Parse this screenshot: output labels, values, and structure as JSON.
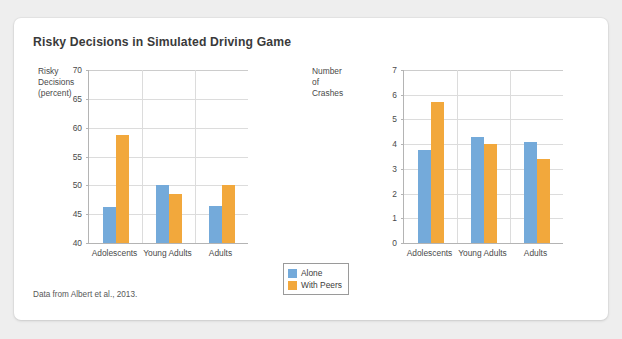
{
  "figure": {
    "title": "Risky Decisions in Simulated Driving Game",
    "source_note": "Data from Albert et al., 2013.",
    "colors": {
      "alone": "#74aada",
      "with_peers": "#f2a83c",
      "card_background": "#ffffff",
      "page_background": "#eeeeee",
      "gridline": "#dcdcdc",
      "axis": "#b4b4b4",
      "text": "#4a4a4a"
    }
  },
  "legend": {
    "position": "bottom-center",
    "entries": [
      {
        "label": "Alone",
        "color": "#74aada"
      },
      {
        "label": "With Peers",
        "color": "#f2a83c"
      }
    ]
  },
  "chart_data": [
    {
      "type": "bar",
      "id": "risky-decisions",
      "title": "",
      "ylabel": "Risky\nDecisions\n(percent)",
      "xlabel": "",
      "categories": [
        "Adolescents",
        "Young Adults",
        "Adults"
      ],
      "ticks": [
        40,
        45,
        50,
        55,
        60,
        65,
        70
      ],
      "ylim": [
        40,
        70
      ],
      "grid": true,
      "series": [
        {
          "name": "Alone",
          "color": "#74aada",
          "values": [
            46.3,
            50.0,
            46.5
          ]
        },
        {
          "name": "With Peers",
          "color": "#f2a83c",
          "values": [
            58.8,
            48.5,
            50.1
          ]
        }
      ]
    },
    {
      "type": "bar",
      "id": "number-of-crashes",
      "title": "",
      "ylabel": "Number of\nCrashes",
      "xlabel": "",
      "categories": [
        "Adolescents",
        "Young Adults",
        "Adults"
      ],
      "ticks": [
        0,
        1,
        2,
        3,
        4,
        5,
        6,
        7
      ],
      "ylim": [
        0,
        7
      ],
      "grid": true,
      "series": [
        {
          "name": "Alone",
          "color": "#74aada",
          "values": [
            3.75,
            4.3,
            4.1
          ]
        },
        {
          "name": "With Peers",
          "color": "#f2a83c",
          "values": [
            5.7,
            4.0,
            3.4
          ]
        }
      ]
    }
  ]
}
